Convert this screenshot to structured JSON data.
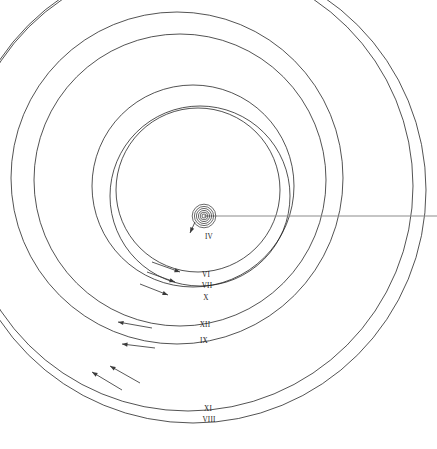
{
  "figure": {
    "background_color": "#ffffff",
    "line_color": "#1a1a1a",
    "axis_color": "#8c8c8c",
    "width": 437,
    "height": 449
  },
  "center": {
    "x": 204,
    "y": 216,
    "label": "IV",
    "ring_count": 6,
    "ring_radii": [
      2.0,
      3.8,
      5.6,
      7.6,
      9.6,
      11.8
    ]
  },
  "axis": {
    "name": "horizontal-reference-line",
    "x1": 204,
    "y1": 216,
    "x2": 437,
    "y2": 216
  },
  "orbits": [
    {
      "label": "IV",
      "cx": 204,
      "cy": 216,
      "r": 11.8,
      "label_x": 209,
      "label_y": 239
    },
    {
      "label": "VI",
      "cx": 198,
      "cy": 190,
      "r": 82,
      "label_x": 206,
      "label_y": 277
    },
    {
      "label": "VII",
      "cx": 200,
      "cy": 196,
      "r": 90,
      "label_x": 207,
      "label_y": 288
    },
    {
      "label": "X",
      "cx": 193,
      "cy": 186,
      "r": 101,
      "label_x": 206,
      "label_y": 300
    },
    {
      "label": "XII",
      "cx": 180,
      "cy": 180,
      "r": 146,
      "label_x": 205,
      "label_y": 327
    },
    {
      "label": "IX",
      "cx": 177,
      "cy": 178,
      "r": 166,
      "label_x": 204,
      "label_y": 343
    },
    {
      "label": "XI",
      "cx": 188,
      "cy": 186,
      "r": 225,
      "label_x": 208,
      "label_y": 411
    },
    {
      "label": "VIII",
      "cx": 193,
      "cy": 190,
      "r": 233,
      "label_x": 209,
      "label_y": 422
    }
  ],
  "arrows": [
    {
      "name": "center-motion-arrow",
      "x1": 195,
      "y1": 222,
      "x2": 190,
      "y2": 233,
      "direction": "down-left"
    },
    {
      "name": "orbit-vi-motion-arrow",
      "x1": 152,
      "y1": 262,
      "x2": 180,
      "y2": 272,
      "direction": "down-right"
    },
    {
      "name": "orbit-vii-motion-arrow",
      "x1": 147,
      "y1": 272,
      "x2": 175,
      "y2": 282,
      "direction": "down-right"
    },
    {
      "name": "orbit-x-motion-arrow",
      "x1": 140,
      "y1": 284,
      "x2": 168,
      "y2": 295,
      "direction": "down-right"
    },
    {
      "name": "orbit-xii-motion-arrow",
      "x1": 152,
      "y1": 328,
      "x2": 118,
      "y2": 322,
      "direction": "up-left"
    },
    {
      "name": "orbit-ix-motion-arrow",
      "x1": 155,
      "y1": 348,
      "x2": 122,
      "y2": 344,
      "direction": "left"
    },
    {
      "name": "orbit-xi-motion-arrow",
      "x1": 140,
      "y1": 383,
      "x2": 110,
      "y2": 366,
      "direction": "up-left"
    },
    {
      "name": "orbit-viii-motion-arrow",
      "x1": 122,
      "y1": 390,
      "x2": 92,
      "y2": 372,
      "direction": "up-left"
    }
  ]
}
